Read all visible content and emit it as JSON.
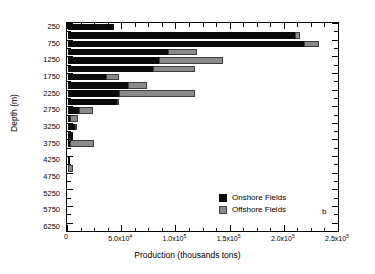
{
  "chart_data": {
    "type": "bar",
    "orientation": "horizontal",
    "stacked": true,
    "title": "",
    "panel_label": "b",
    "xlabel": "Production (thousands tons)",
    "ylabel": "Depth (m)",
    "xlim": [
      0,
      250000
    ],
    "ylim_categories_top_to_bottom": true,
    "grid": false,
    "legend_position": "inside lower right",
    "xticks": [
      0,
      50000,
      100000,
      150000,
      200000,
      250000
    ],
    "xticklabels": [
      "0",
      "5.0x10⁴",
      "1.0x10⁵",
      "1.5x10⁵",
      "2.0x10⁵",
      "2.5x10⁵"
    ],
    "xtick_minor_interval": 12500,
    "yticklabels": [
      "250",
      "750",
      "1250",
      "1750",
      "2250",
      "2750",
      "3250",
      "3750",
      "4250",
      "4750",
      "5250",
      "5750",
      "6250"
    ],
    "categories": [
      250,
      500,
      750,
      1000,
      1250,
      1500,
      1750,
      2000,
      2250,
      2500,
      2750,
      3000,
      3250,
      3500,
      3750,
      4000,
      4250,
      4500,
      4750,
      5000,
      5250,
      5500,
      5750,
      6000,
      6250
    ],
    "series": [
      {
        "name": "Onshore Fields",
        "color": "#0a0a0a",
        "values": [
          42400,
          209000,
          218000,
          92000,
          84000,
          78000,
          35000,
          55000,
          47000,
          45000,
          10000,
          2000,
          6000,
          5000,
          2000,
          0,
          1500,
          0,
          0,
          0,
          0,
          0,
          0,
          0,
          0
        ]
      },
      {
        "name": "Offshore Fields",
        "color": "#8a8a8a",
        "values": [
          0,
          5000,
          14000,
          27000,
          59000,
          39000,
          12000,
          18000,
          70000,
          1500,
          13000,
          7000,
          2500,
          0,
          22000,
          0,
          0,
          5000,
          0,
          0,
          0,
          0,
          0,
          0,
          0
        ]
      }
    ]
  },
  "legend": {
    "items": [
      {
        "label": "Onshore Fields",
        "swatch": "onshore-swatch"
      },
      {
        "label": "Offshore Fields",
        "swatch": "offshore-swatch"
      }
    ]
  },
  "axes": {
    "x_title": "Production (thousands tons)",
    "y_title": "Depth (m)"
  }
}
